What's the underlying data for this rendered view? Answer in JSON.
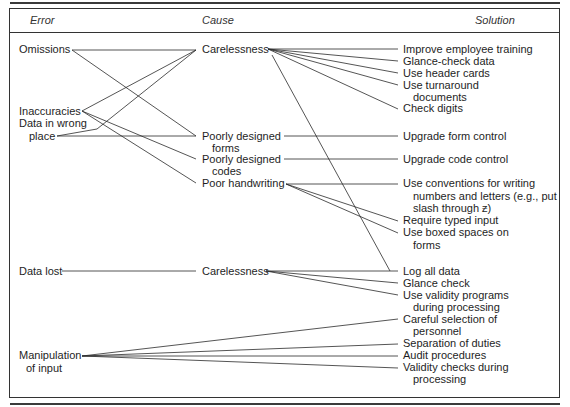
{
  "headers": {
    "error": "Error",
    "cause": "Cause",
    "solution": "Solution"
  },
  "errors": {
    "omissions": "Omissions",
    "inaccuracies": "Inaccuracies",
    "data_wrong_1": "Data in wrong",
    "data_wrong_2": "place",
    "data_lost": "Data lost",
    "manipulation_1": "Manipulation",
    "manipulation_2": "of input"
  },
  "causes": {
    "carelessness": "Carelessness",
    "poor_forms_1": "Poorly designed",
    "poor_forms_2": "forms",
    "poor_codes_1": "Poorly designed",
    "poor_codes_2": "codes",
    "poor_handwriting": "Poor handwriting",
    "carelessness_2": "Carelessness"
  },
  "solutions": {
    "improve_training": "Improve employee training",
    "glance_check_data": "Glance-check data",
    "header_cards": "Use header cards",
    "turnaround_1": "Use turnaround",
    "turnaround_2": "documents",
    "check_digits": "Check digits",
    "upgrade_form": "Upgrade form control",
    "upgrade_code": "Upgrade code control",
    "conventions_1": "Use conventions for writing",
    "conventions_2": "numbers and letters (e.g., put",
    "conventions_3": "slash through ƶ)",
    "typed_input": "Require typed input",
    "boxed_1": "Use  boxed spaces on",
    "boxed_2": "forms",
    "log_all": "Log all data",
    "glance_check": "Glance check",
    "validity_programs_1": "Use validity programs",
    "validity_programs_2": "during processing",
    "careful_selection_1": "Careful selection of",
    "careful_selection_2": "personnel",
    "separation": "Separation of duties",
    "audit": "Audit procedures",
    "validity_checks_1": "Validity checks during",
    "validity_checks_2": "processing"
  }
}
